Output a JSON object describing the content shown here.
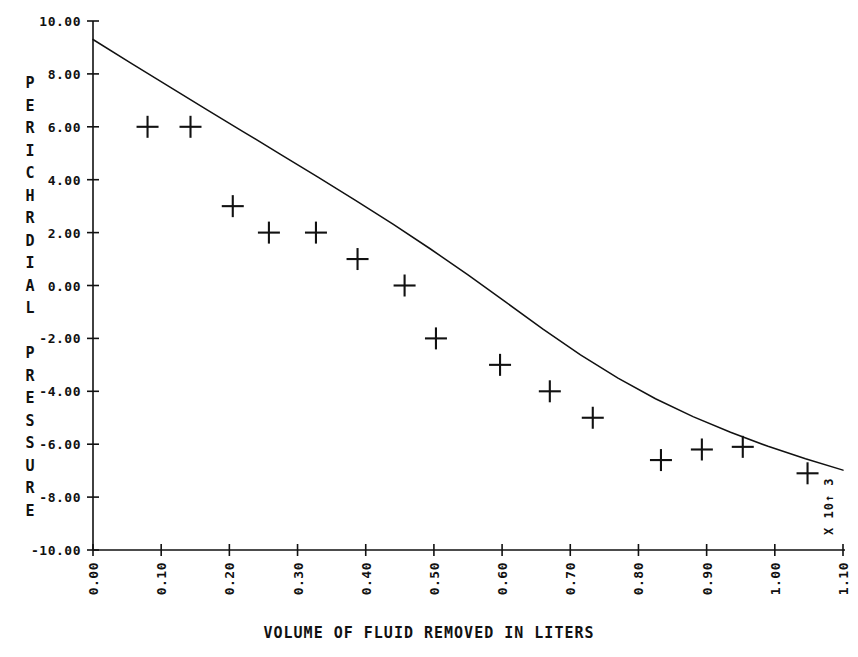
{
  "chart_data": {
    "type": "scatter",
    "title": "",
    "xlabel": "VOLUME OF FLUID REMOVED IN LITERS",
    "ylabel": "PERICHRDIAL PRESSURE",
    "x_multiplier_note": "X 10↑ 3",
    "xlim": [
      0.0,
      1.1
    ],
    "ylim": [
      -10.0,
      10.0
    ],
    "grid": false,
    "legend": "none",
    "xticks": [
      0.0,
      0.1,
      0.2,
      0.3,
      0.4,
      0.5,
      0.6,
      0.7,
      0.8,
      0.9,
      1.0,
      1.1
    ],
    "xtick_labels": [
      "0.00",
      "0.10",
      "0.20",
      "0.30",
      "0.40",
      "0.50",
      "0.60",
      "0.70",
      "0.80",
      "0.90",
      "1.00",
      "1.10"
    ],
    "yticks": [
      10.0,
      8.0,
      6.0,
      4.0,
      2.0,
      0.0,
      -2.0,
      -4.0,
      -6.0,
      -8.0,
      -10.0
    ],
    "ytick_labels": [
      "10.00",
      "8.00",
      "6.00",
      "4.00",
      "2.00",
      "0.00",
      "-2.00",
      "-4.00",
      "-6.00",
      "-8.00",
      "-10.00"
    ],
    "series": [
      {
        "name": "measured points",
        "marker": "plus",
        "x": [
          0.08,
          0.143,
          0.205,
          0.258,
          0.327,
          0.388,
          0.457,
          0.503,
          0.597,
          0.67,
          0.733,
          0.833,
          0.893,
          0.953,
          1.048
        ],
        "y": [
          6.0,
          6.0,
          3.0,
          2.0,
          2.0,
          1.0,
          0.0,
          -2.0,
          -3.0,
          -4.0,
          -5.0,
          -6.6,
          -6.2,
          -6.1,
          -7.1
        ]
      },
      {
        "name": "fitted curve",
        "marker": "none",
        "x": [
          0.0,
          0.055,
          0.11,
          0.165,
          0.22,
          0.275,
          0.33,
          0.385,
          0.44,
          0.495,
          0.55,
          0.605,
          0.66,
          0.715,
          0.77,
          0.825,
          0.88,
          0.935,
          0.99,
          1.045,
          1.1
        ],
        "y": [
          9.3,
          8.42,
          7.55,
          6.68,
          5.82,
          4.96,
          4.1,
          3.22,
          2.32,
          1.38,
          0.4,
          -0.62,
          -1.65,
          -2.62,
          -3.5,
          -4.28,
          -4.96,
          -5.55,
          -6.08,
          -6.55,
          -6.98
        ]
      }
    ]
  },
  "axes": {
    "y_axis_title_letters": [
      "P",
      "E",
      "R",
      "I",
      "C",
      "H",
      "R",
      "D",
      "I",
      "A",
      "L",
      "",
      "P",
      "R",
      "E",
      "S",
      "S",
      "U",
      "R",
      "E"
    ],
    "x_axis_title": "VOLUME OF FLUID REMOVED IN LITERS",
    "x_exponent_label": "X 10↑ 3"
  },
  "colors": {
    "ink": "#111111",
    "background": "#ffffff"
  }
}
